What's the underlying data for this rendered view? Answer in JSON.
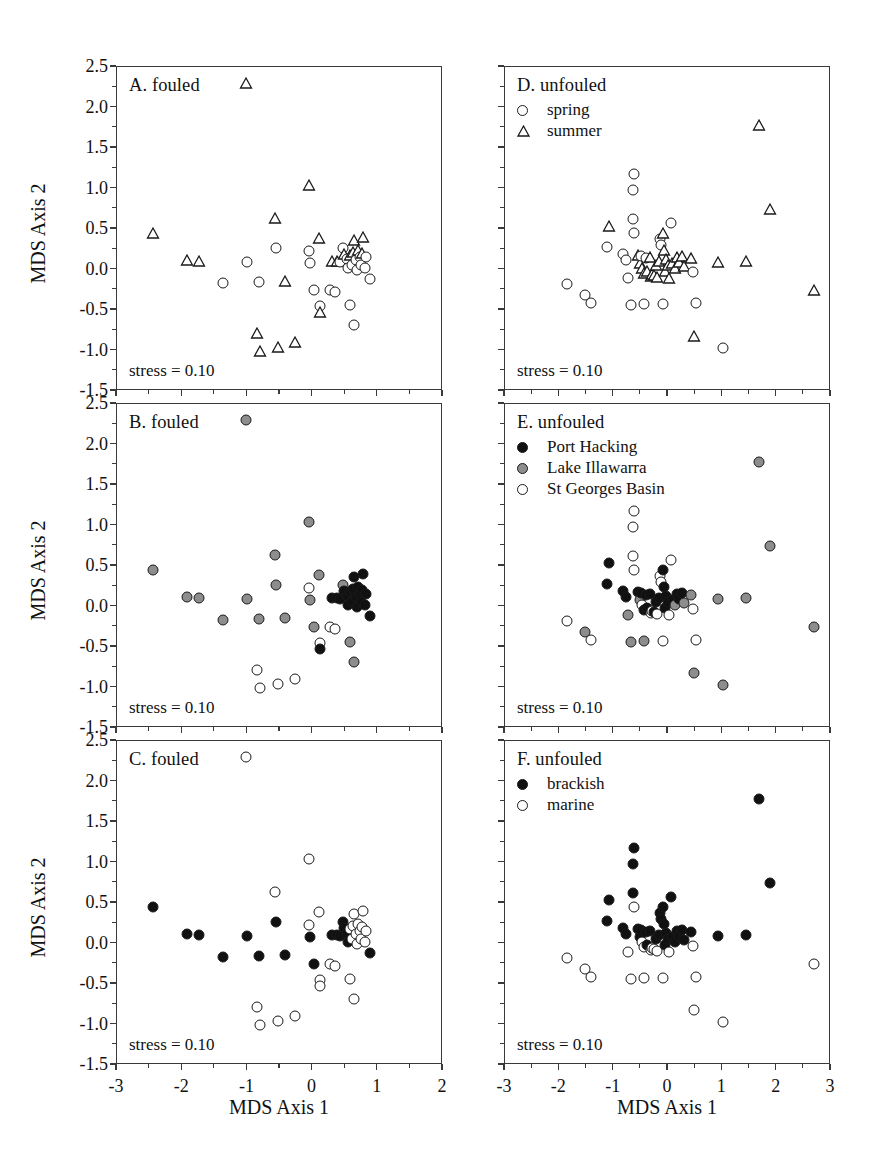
{
  "figure": {
    "width": 871,
    "height": 1173,
    "background": "#ffffff",
    "axis_color": "#3a3a3a",
    "marker_black": "#111111",
    "marker_grey": "#8d8d8d",
    "marker_open": "#ffffff"
  },
  "axes": {
    "x_title": "MDS Axis 1",
    "y_title": "MDS Axis 2",
    "y_ticks": [
      "2.5",
      "2.0",
      "1.5",
      "1.0",
      "0.5",
      "0.0",
      "-0.5",
      "-1.0",
      "-1.5"
    ],
    "y_tick_values": [
      2.5,
      2.0,
      1.5,
      1.0,
      0.5,
      0.0,
      -0.5,
      -1.0,
      -1.5
    ],
    "x_ticks_left": [
      "-3",
      "-2",
      "-1",
      "0",
      "1",
      "2"
    ],
    "x_tick_values_left": [
      -3,
      -2,
      -1,
      0,
      1,
      2
    ],
    "x_ticks_right": [
      "-3",
      "-2",
      "-1",
      "0",
      "1",
      "2",
      "3"
    ],
    "x_tick_values_right": [
      -3,
      -2,
      -1,
      0,
      1,
      2,
      3
    ],
    "ylim": [
      -1.5,
      2.5
    ],
    "xlim_left": [
      -3,
      2
    ],
    "xlim_right": [
      -3,
      3
    ]
  },
  "stress_label": "stress = 0.10",
  "panels": [
    {
      "id": "A",
      "label": "A. fouled",
      "column": "left",
      "row": 0
    },
    {
      "id": "B",
      "label": "B. fouled",
      "column": "left",
      "row": 1
    },
    {
      "id": "C",
      "label": "C. fouled",
      "column": "left",
      "row": 2
    },
    {
      "id": "D",
      "label": "D. unfouled",
      "column": "right",
      "row": 0
    },
    {
      "id": "E",
      "label": "E. unfouled",
      "column": "right",
      "row": 1
    },
    {
      "id": "F",
      "label": "F. unfouled",
      "column": "right",
      "row": 2
    }
  ],
  "legends": {
    "D": [
      {
        "marker": "circle-open",
        "label": "spring"
      },
      {
        "marker": "triangle-open",
        "label": "summer"
      }
    ],
    "E": [
      {
        "marker": "circle-black",
        "label": "Port Hacking"
      },
      {
        "marker": "circle-grey",
        "label": "Lake Illawarra"
      },
      {
        "marker": "circle-open",
        "label": "St Georges Basin"
      }
    ],
    "F": [
      {
        "marker": "circle-black",
        "label": "brackish"
      },
      {
        "marker": "circle-open",
        "label": "marine"
      }
    ]
  },
  "chart_data": {
    "type": "scatter",
    "xlabel": "MDS Axis 1",
    "ylabel": "MDS Axis 2",
    "grid": false,
    "panel_count": 6,
    "note": "Panels A/B/C share one fouled ordination; panels D/E/F share one unfouled ordination. Only the symbol coding differs between panels in each column.",
    "fouled_points": [
      {
        "x": -2.45,
        "y": 0.45,
        "season": "summer",
        "site": "Lake Illawarra",
        "salinity": "brackish"
      },
      {
        "x": -1.93,
        "y": 0.12,
        "season": "summer",
        "site": "Lake Illawarra",
        "salinity": "brackish"
      },
      {
        "x": -1.74,
        "y": 0.11,
        "season": "summer",
        "site": "Lake Illawarra",
        "salinity": "brackish"
      },
      {
        "x": -1.37,
        "y": -0.17,
        "season": "spring",
        "site": "Lake Illawarra",
        "salinity": "brackish"
      },
      {
        "x": -1.02,
        "y": 2.3,
        "season": "summer",
        "site": "Lake Illawarra",
        "salinity": "marine"
      },
      {
        "x": -1.0,
        "y": 0.09,
        "season": "spring",
        "site": "Lake Illawarra",
        "salinity": "brackish"
      },
      {
        "x": -0.86,
        "y": -0.78,
        "season": "summer",
        "site": "St Georges Basin",
        "salinity": "marine"
      },
      {
        "x": -0.81,
        "y": -1.0,
        "season": "summer",
        "site": "St Georges Basin",
        "salinity": "marine"
      },
      {
        "x": -0.82,
        "y": -0.15,
        "season": "spring",
        "site": "Lake Illawarra",
        "salinity": "brackish"
      },
      {
        "x": -0.57,
        "y": 0.64,
        "season": "summer",
        "site": "Lake Illawarra",
        "salinity": "marine"
      },
      {
        "x": -0.56,
        "y": 0.27,
        "season": "spring",
        "site": "Lake Illawarra",
        "salinity": "brackish"
      },
      {
        "x": -0.53,
        "y": -0.96,
        "season": "summer",
        "site": "St Georges Basin",
        "salinity": "marine"
      },
      {
        "x": -0.43,
        "y": -0.14,
        "season": "summer",
        "site": "Lake Illawarra",
        "salinity": "brackish"
      },
      {
        "x": -0.27,
        "y": -0.9,
        "season": "summer",
        "site": "St Georges Basin",
        "salinity": "marine"
      },
      {
        "x": -0.05,
        "y": 1.04,
        "season": "summer",
        "site": "Lake Illawarra",
        "salinity": "marine"
      },
      {
        "x": -0.06,
        "y": 0.23,
        "season": "spring",
        "site": "St Georges Basin",
        "salinity": "marine"
      },
      {
        "x": -0.04,
        "y": 0.08,
        "season": "spring",
        "site": "Lake Illawarra",
        "salinity": "brackish"
      },
      {
        "x": 0.02,
        "y": -0.25,
        "season": "spring",
        "site": "Lake Illawarra",
        "salinity": "brackish"
      },
      {
        "x": 0.1,
        "y": 0.39,
        "season": "summer",
        "site": "Lake Illawarra",
        "salinity": "marine"
      },
      {
        "x": 0.12,
        "y": -0.45,
        "season": "spring",
        "site": "St Georges Basin",
        "salinity": "marine"
      },
      {
        "x": 0.12,
        "y": -0.52,
        "season": "summer",
        "site": "Port Hacking",
        "salinity": "marine"
      },
      {
        "x": 0.27,
        "y": -0.25,
        "season": "spring",
        "site": "St Georges Basin",
        "salinity": "marine"
      },
      {
        "x": 0.34,
        "y": -0.28,
        "season": "spring",
        "site": "St Georges Basin",
        "salinity": "marine"
      },
      {
        "x": 0.3,
        "y": 0.11,
        "season": "summer",
        "site": "Port Hacking",
        "salinity": "brackish"
      },
      {
        "x": 0.38,
        "y": 0.11,
        "season": "summer",
        "site": "Port Hacking",
        "salinity": "brackish"
      },
      {
        "x": 0.42,
        "y": 0.09,
        "season": "spring",
        "site": "Port Hacking",
        "salinity": "brackish"
      },
      {
        "x": 0.46,
        "y": 0.26,
        "season": "spring",
        "site": "Lake Illawarra",
        "salinity": "brackish"
      },
      {
        "x": 0.48,
        "y": 0.19,
        "season": "summer",
        "site": "Port Hacking",
        "salinity": "brackish"
      },
      {
        "x": 0.52,
        "y": 0.13,
        "season": "spring",
        "site": "Port Hacking",
        "salinity": "brackish"
      },
      {
        "x": 0.55,
        "y": 0.02,
        "season": "spring",
        "site": "Port Hacking",
        "salinity": "brackish"
      },
      {
        "x": 0.58,
        "y": 0.18,
        "season": "summer",
        "site": "Port Hacking",
        "salinity": "marine"
      },
      {
        "x": 0.6,
        "y": 0.05,
        "season": "spring",
        "site": "Port Hacking",
        "salinity": "marine"
      },
      {
        "x": 0.62,
        "y": 0.21,
        "season": "summer",
        "site": "Port Hacking",
        "salinity": "marine"
      },
      {
        "x": 0.64,
        "y": 0.36,
        "season": "summer",
        "site": "Port Hacking",
        "salinity": "marine"
      },
      {
        "x": 0.66,
        "y": 0.12,
        "season": "spring",
        "site": "Port Hacking",
        "salinity": "marine"
      },
      {
        "x": 0.68,
        "y": 0.0,
        "season": "spring",
        "site": "Port Hacking",
        "salinity": "marine"
      },
      {
        "x": 0.7,
        "y": 0.24,
        "season": "summer",
        "site": "Port Hacking",
        "salinity": "marine"
      },
      {
        "x": 0.72,
        "y": 0.16,
        "season": "spring",
        "site": "Port Hacking",
        "salinity": "marine"
      },
      {
        "x": 0.74,
        "y": 0.05,
        "season": "spring",
        "site": "Port Hacking",
        "salinity": "marine"
      },
      {
        "x": 0.76,
        "y": 0.2,
        "season": "summer",
        "site": "Port Hacking",
        "salinity": "marine"
      },
      {
        "x": 0.78,
        "y": 0.4,
        "season": "summer",
        "site": "Port Hacking",
        "salinity": "marine"
      },
      {
        "x": 0.8,
        "y": 0.02,
        "season": "spring",
        "site": "Port Hacking",
        "salinity": "marine"
      },
      {
        "x": 0.82,
        "y": 0.15,
        "season": "spring",
        "site": "Port Hacking",
        "salinity": "marine"
      },
      {
        "x": 0.57,
        "y": -0.44,
        "season": "spring",
        "site": "Lake Illawarra",
        "salinity": "marine"
      },
      {
        "x": 0.64,
        "y": -0.68,
        "season": "spring",
        "site": "Lake Illawarra",
        "salinity": "marine"
      },
      {
        "x": 0.88,
        "y": -0.12,
        "season": "spring",
        "site": "Port Hacking",
        "salinity": "brackish"
      }
    ],
    "unfouled_points": [
      {
        "x": -1.85,
        "y": -0.18,
        "season": "spring",
        "site": "St Georges Basin",
        "salinity": "marine"
      },
      {
        "x": -1.52,
        "y": -0.32,
        "season": "spring",
        "site": "Lake Illawarra",
        "salinity": "marine"
      },
      {
        "x": -1.42,
        "y": -0.41,
        "season": "spring",
        "site": "St Georges Basin",
        "salinity": "marine"
      },
      {
        "x": -1.12,
        "y": 0.28,
        "season": "spring",
        "site": "Port Hacking",
        "salinity": "brackish"
      },
      {
        "x": -1.08,
        "y": 0.54,
        "season": "summer",
        "site": "Port Hacking",
        "salinity": "brackish"
      },
      {
        "x": -0.82,
        "y": 0.19,
        "season": "spring",
        "site": "Port Hacking",
        "salinity": "brackish"
      },
      {
        "x": -0.78,
        "y": 0.12,
        "season": "spring",
        "site": "Port Hacking",
        "salinity": "brackish"
      },
      {
        "x": -0.74,
        "y": -0.1,
        "season": "spring",
        "site": "Lake Illawarra",
        "salinity": "marine"
      },
      {
        "x": -0.68,
        "y": -0.44,
        "season": "spring",
        "site": "Lake Illawarra",
        "salinity": "marine"
      },
      {
        "x": -0.62,
        "y": 1.18,
        "season": "spring",
        "site": "St Georges Basin",
        "salinity": "brackish"
      },
      {
        "x": -0.65,
        "y": 0.98,
        "season": "spring",
        "site": "St Georges Basin",
        "salinity": "brackish"
      },
      {
        "x": -0.64,
        "y": 0.62,
        "season": "spring",
        "site": "St Georges Basin",
        "salinity": "brackish"
      },
      {
        "x": -0.62,
        "y": 0.45,
        "season": "spring",
        "site": "St Georges Basin",
        "salinity": "marine"
      },
      {
        "x": -0.56,
        "y": 0.18,
        "season": "summer",
        "site": "Port Hacking",
        "salinity": "brackish"
      },
      {
        "x": -0.52,
        "y": 0.08,
        "season": "summer",
        "site": "Lake Illawarra",
        "salinity": "brackish"
      },
      {
        "x": -0.5,
        "y": 0.17,
        "season": "spring",
        "site": "Port Hacking",
        "salinity": "brackish"
      },
      {
        "x": -0.47,
        "y": 0.02,
        "season": "summer",
        "site": "St Georges Basin",
        "salinity": "marine"
      },
      {
        "x": -0.44,
        "y": -0.04,
        "season": "summer",
        "site": "Port Hacking",
        "salinity": "marine"
      },
      {
        "x": -0.4,
        "y": 0.14,
        "season": "spring",
        "site": "Port Hacking",
        "salinity": "brackish"
      },
      {
        "x": -0.38,
        "y": -0.02,
        "season": "summer",
        "site": "Port Hacking",
        "salinity": "brackish"
      },
      {
        "x": -0.34,
        "y": 0.16,
        "season": "summer",
        "site": "Port Hacking",
        "salinity": "brackish"
      },
      {
        "x": -0.32,
        "y": -0.08,
        "season": "summer",
        "site": "St Georges Basin",
        "salinity": "marine"
      },
      {
        "x": -0.3,
        "y": -0.05,
        "season": "summer",
        "site": "St Georges Basin",
        "salinity": "marine"
      },
      {
        "x": -0.26,
        "y": -0.07,
        "season": "summer",
        "site": "Port Hacking",
        "salinity": "marine"
      },
      {
        "x": -0.22,
        "y": 0.06,
        "season": "summer",
        "site": "Port Hacking",
        "salinity": "brackish"
      },
      {
        "x": -0.2,
        "y": -0.09,
        "season": "summer",
        "site": "St Georges Basin",
        "salinity": "marine"
      },
      {
        "x": -0.16,
        "y": 0.11,
        "season": "summer",
        "site": "Port Hacking",
        "salinity": "brackish"
      },
      {
        "x": -0.14,
        "y": 0.38,
        "season": "spring",
        "site": "St Georges Basin",
        "salinity": "brackish"
      },
      {
        "x": -0.12,
        "y": 0.3,
        "season": "spring",
        "site": "St Georges Basin",
        "salinity": "brackish"
      },
      {
        "x": -0.1,
        "y": 0.45,
        "season": "summer",
        "site": "Port Hacking",
        "salinity": "brackish"
      },
      {
        "x": -0.08,
        "y": 0.24,
        "season": "summer",
        "site": "Port Hacking",
        "salinity": "brackish"
      },
      {
        "x": -0.06,
        "y": -0.02,
        "season": "summer",
        "site": "Port Hacking",
        "salinity": "brackish"
      },
      {
        "x": -0.04,
        "y": 0.13,
        "season": "summer",
        "site": "Port Hacking",
        "salinity": "brackish"
      },
      {
        "x": 0.0,
        "y": 0.05,
        "season": "summer",
        "site": "Port Hacking",
        "salinity": "brackish"
      },
      {
        "x": 0.02,
        "y": -0.1,
        "season": "summer",
        "site": "St Georges Basin",
        "salinity": "marine"
      },
      {
        "x": 0.06,
        "y": 0.58,
        "season": "spring",
        "site": "St Georges Basin",
        "salinity": "brackish"
      },
      {
        "x": 0.08,
        "y": 0.08,
        "season": "summer",
        "site": "Port Hacking",
        "salinity": "brackish"
      },
      {
        "x": 0.12,
        "y": 0.02,
        "season": "summer",
        "site": "Lake Illawarra",
        "salinity": "brackish"
      },
      {
        "x": 0.16,
        "y": 0.16,
        "season": "summer",
        "site": "Port Hacking",
        "salinity": "brackish"
      },
      {
        "x": 0.2,
        "y": 0.09,
        "season": "summer",
        "site": "Port Hacking",
        "salinity": "brackish"
      },
      {
        "x": 0.26,
        "y": 0.17,
        "season": "summer",
        "site": "Port Hacking",
        "salinity": "brackish"
      },
      {
        "x": 0.3,
        "y": 0.04,
        "season": "summer",
        "site": "Lake Illawarra",
        "salinity": "brackish"
      },
      {
        "x": 0.42,
        "y": 0.14,
        "season": "summer",
        "site": "Lake Illawarra",
        "salinity": "brackish"
      },
      {
        "x": 0.46,
        "y": -0.03,
        "season": "spring",
        "site": "St Georges Basin",
        "salinity": "marine"
      },
      {
        "x": 0.52,
        "y": -0.41,
        "season": "spring",
        "site": "St Georges Basin",
        "salinity": "marine"
      },
      {
        "x": 0.48,
        "y": -0.82,
        "season": "summer",
        "site": "Lake Illawarra",
        "salinity": "marine"
      },
      {
        "x": -0.44,
        "y": -0.42,
        "season": "spring",
        "site": "Lake Illawarra",
        "salinity": "marine"
      },
      {
        "x": -0.1,
        "y": -0.43,
        "season": "spring",
        "site": "St Georges Basin",
        "salinity": "marine"
      },
      {
        "x": 0.92,
        "y": 0.09,
        "season": "summer",
        "site": "Lake Illawarra",
        "salinity": "brackish"
      },
      {
        "x": 1.02,
        "y": -0.97,
        "season": "spring",
        "site": "Lake Illawarra",
        "salinity": "marine"
      },
      {
        "x": 1.68,
        "y": 1.79,
        "season": "summer",
        "site": "Lake Illawarra",
        "salinity": "brackish"
      },
      {
        "x": 1.88,
        "y": 0.75,
        "season": "summer",
        "site": "Lake Illawarra",
        "salinity": "brackish"
      },
      {
        "x": 1.44,
        "y": 0.1,
        "season": "summer",
        "site": "Lake Illawarra",
        "salinity": "brackish"
      },
      {
        "x": 2.68,
        "y": -0.25,
        "season": "summer",
        "site": "Lake Illawarra",
        "salinity": "marine"
      }
    ]
  }
}
